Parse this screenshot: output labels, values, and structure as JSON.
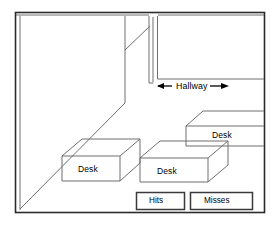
{
  "diagram": {
    "title": "",
    "type": "isometric-room-floorplan",
    "frame": {
      "stroke": "#2b2b2b",
      "fill": "#ffffff"
    },
    "line_color": "#6a6a6a",
    "labels": {
      "hallway": "Hallway",
      "desk_left": "Desk",
      "desk_middle": "Desk",
      "desk_right": "Desk"
    },
    "arrows": {
      "left_arrow": "left-arrow-icon",
      "right_arrow": "right-arrow-icon"
    },
    "buttons": [
      {
        "name": "hits-button",
        "label": "Hits"
      },
      {
        "name": "misses-button",
        "label": "Misses"
      }
    ]
  }
}
